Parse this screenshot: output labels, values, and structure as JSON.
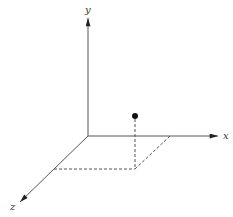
{
  "diagram": {
    "type": "3d-coordinate-axes",
    "axes": {
      "x": {
        "label": "x",
        "origin": [
          88,
          136
        ],
        "tip": [
          218,
          136
        ],
        "label_pos": [
          226,
          139
        ]
      },
      "y": {
        "label": "y",
        "origin": [
          88,
          136
        ],
        "tip": [
          88,
          18
        ],
        "label_pos": [
          86,
          12
        ]
      },
      "z": {
        "label": "z",
        "origin": [
          88,
          136
        ],
        "tip": [
          20,
          202
        ],
        "label_pos": [
          12,
          210
        ]
      }
    },
    "point": {
      "pos": [
        135,
        116
      ],
      "radius": 3
    },
    "projection": {
      "vertical_drop": [
        [
          135,
          119
        ],
        [
          135,
          169
        ]
      ],
      "parallelogram": [
        [
          54,
          169
        ],
        [
          135,
          169
        ],
        [
          170,
          136
        ]
      ]
    },
    "colors": {
      "stroke": "#444444",
      "point": "#111111",
      "background": "#ffffff"
    }
  }
}
